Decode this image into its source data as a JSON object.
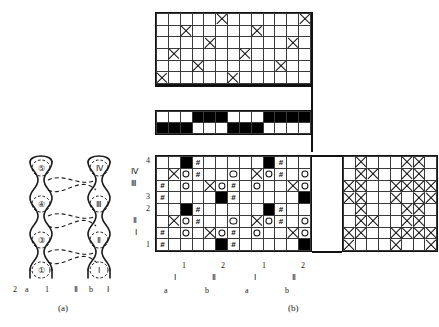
{
  "figure": {
    "caption_a": "(a)",
    "caption_b": "(b)"
  },
  "panel_a": {
    "name": "interlacing-schematic",
    "left_column_nodes": [
      "④",
      "③",
      "②",
      "①"
    ],
    "right_column_nodes": [
      "Ⅳ",
      "Ⅲ",
      "Ⅱ",
      "Ⅰ"
    ],
    "bottom_labels": [
      "2",
      "a",
      "1",
      "Ⅱ",
      "b",
      "Ⅰ"
    ]
  },
  "chart_data": {
    "type": "heatmap",
    "grids": [
      {
        "name": "top-draft-grid",
        "role": "threading / lifting plan",
        "cols": 13,
        "rows": 6,
        "cell_px": 12,
        "symbols": {
          "x": "cross"
        },
        "cells": [
          [
            "",
            "",
            "",
            "",
            "",
            "x",
            "",
            "",
            "",
            "",
            "",
            "",
            "x"
          ],
          [
            "",
            "",
            "x",
            "",
            "",
            "",
            "",
            "",
            "x",
            "",
            "",
            "",
            ""
          ],
          [
            "",
            "",
            "",
            "",
            "x",
            "",
            "",
            "",
            "",
            "",
            "",
            "x",
            ""
          ],
          [
            "",
            "x",
            "",
            "",
            "",
            "",
            "",
            "x",
            "",
            "",
            "",
            "",
            ""
          ],
          [
            "",
            "",
            "",
            "x",
            "",
            "",
            "",
            "",
            "",
            "",
            "x",
            "",
            ""
          ],
          [
            "x",
            "",
            "",
            "",
            "",
            "",
            "x",
            "",
            "",
            "",
            "",
            "",
            ""
          ]
        ]
      },
      {
        "name": "tie-up-band-grid",
        "role": "colour / denting band",
        "cols": 13,
        "rows": 2,
        "cell_px": 12,
        "symbols": {
          "f": "solid-black"
        },
        "cells": [
          [
            "",
            "",
            "",
            "f",
            "f",
            "f",
            "",
            "",
            "",
            "f",
            "f",
            "f",
            "f"
          ],
          [
            "f",
            "f",
            "f",
            "",
            "",
            "",
            "f",
            "f",
            "f",
            "",
            "",
            "",
            ""
          ]
        ]
      },
      {
        "name": "main-design-grid",
        "role": "point-paper design",
        "cols": 13,
        "rows": 8,
        "cell_px": 12,
        "symbols": {
          "f": "solid-black",
          "x": "cross",
          "o": "circle",
          "h": "#"
        },
        "cells": [
          [
            "",
            "",
            "f",
            "h",
            "",
            "",
            "",
            "",
            "",
            "f",
            "h",
            "",
            ""
          ],
          [
            "",
            "x",
            "o",
            "h",
            "",
            "",
            "o",
            "",
            "x",
            "o",
            "h",
            "",
            "o"
          ],
          [
            "h",
            "",
            "o",
            "",
            "x",
            "o",
            "h",
            "",
            "o",
            "",
            "",
            "x",
            "o"
          ],
          [
            "h",
            "",
            "",
            "",
            "",
            "f",
            "h",
            "",
            "",
            "",
            "",
            "",
            "f"
          ],
          [
            "",
            "",
            "f",
            "h",
            "",
            "",
            "",
            "",
            "",
            "f",
            "h",
            "",
            ""
          ],
          [
            "",
            "x",
            "o",
            "h",
            "",
            "",
            "o",
            "",
            "x",
            "o",
            "h",
            "",
            "o"
          ],
          [
            "h",
            "",
            "o",
            "",
            "x",
            "o",
            "h",
            "",
            "o",
            "",
            "",
            "x",
            "o"
          ],
          [
            "h",
            "",
            "",
            "",
            "",
            "f",
            "h",
            "",
            "",
            "",
            "",
            "",
            "f"
          ]
        ]
      },
      {
        "name": "right-weave-grid",
        "role": "resulting cloth interlacing",
        "cols": 8,
        "rows": 8,
        "cell_px": 12,
        "symbols": {
          "x": "cross"
        },
        "cells": [
          [
            "",
            "x",
            "",
            "",
            "",
            "x",
            "x",
            ""
          ],
          [
            "",
            "x",
            "x",
            "",
            "",
            "x",
            "x",
            ""
          ],
          [
            "x",
            "x",
            "",
            "",
            "x",
            "x",
            "x",
            "x"
          ],
          [
            "x",
            "x",
            "",
            "",
            "x",
            "",
            "x",
            "x"
          ],
          [
            "",
            "x",
            "",
            "",
            "",
            "x",
            "x",
            ""
          ],
          [
            "",
            "x",
            "x",
            "",
            "",
            "x",
            "x",
            ""
          ],
          [
            "x",
            "x",
            "",
            "",
            "x",
            "x",
            "x",
            "x"
          ],
          [
            "x",
            "",
            "",
            "",
            "x",
            "",
            "",
            "x"
          ]
        ]
      }
    ],
    "axis_labels": {
      "main_grid_left_arabic": [
        "4",
        "3",
        "2",
        "1"
      ],
      "main_grid_left_roman": [
        "Ⅳ",
        "Ⅲ",
        "Ⅱ",
        "Ⅰ"
      ],
      "main_grid_bottom_arabic": [
        "1",
        "2",
        "1",
        "2"
      ],
      "main_grid_bottom_roman": [
        "Ⅰ",
        "Ⅱ",
        "Ⅰ",
        "Ⅱ"
      ],
      "main_grid_bottom_letters": [
        "a",
        "b",
        "a",
        "b"
      ]
    },
    "legend": [
      {
        "symbol": "solid-black",
        "meaning": "warp up (filled square)"
      },
      {
        "symbol": "circle",
        "meaning": "binding point"
      },
      {
        "symbol": "cross",
        "meaning": "interlacing point"
      },
      {
        "symbol": "#",
        "meaning": "hatch marker"
      }
    ],
    "grid": true,
    "legend_position": "none"
  }
}
